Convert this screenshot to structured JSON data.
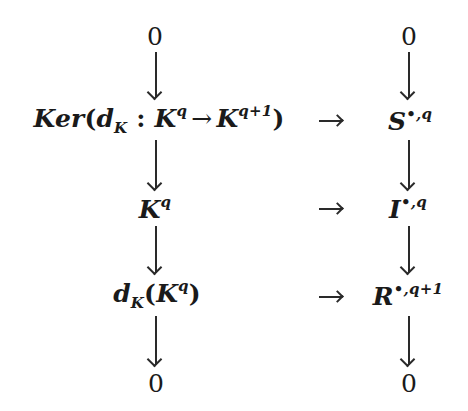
{
  "diagram": {
    "type": "commutative-diagram",
    "columns": {
      "left": {
        "top": "0",
        "row1": {
          "prefix": "Ker",
          "open": "(",
          "map": "d",
          "map_sub": "K",
          "colon": ":",
          "domain_base": "K",
          "domain_sup": "q",
          "arrow": "→",
          "codomain_base": "K",
          "codomain_sup": "q+1",
          "close": ")"
        },
        "row2": {
          "base": "K",
          "sup": "q"
        },
        "row3": {
          "map": "d",
          "map_sub": "K",
          "open": "(",
          "base": "K",
          "sup": "q",
          "close": ")"
        },
        "bottom": "0"
      },
      "right": {
        "top": "0",
        "row1": {
          "base": "S",
          "sup": "•,q"
        },
        "row2": {
          "base": "I",
          "sup": "•,q"
        },
        "row3": {
          "base": "R",
          "sup": "•,q+1"
        },
        "bottom": "0"
      }
    },
    "horizontal_arrows": [
      "→",
      "→",
      "→"
    ],
    "vertical_arrows": {
      "left": 4,
      "right": 4
    }
  }
}
